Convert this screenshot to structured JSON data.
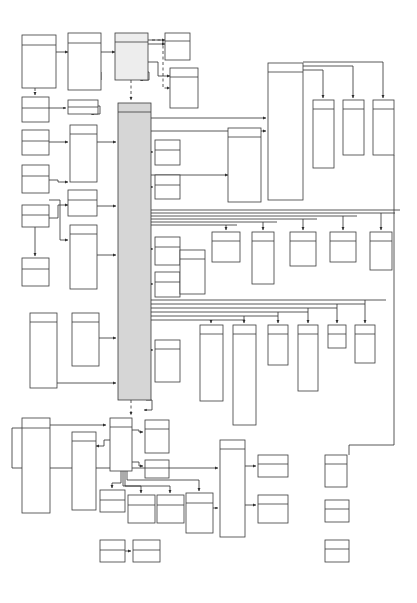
{
  "diagram": {
    "type": "uml-block-diagram",
    "background_color": "#ffffff",
    "stroke_color": "#3a3a3a",
    "node_fill": "#ffffff",
    "bus_fill": "#d6d6d6",
    "accent_fill": "#ededed",
    "canvas": {
      "width": 417,
      "height": 603
    },
    "legend": {
      "node_style": "rectangle with header band",
      "connector_style": "orthogonal polyline with solid arrowhead",
      "dashed_meaning": "dependency"
    },
    "nodes": [
      {
        "id": "n01",
        "label": "",
        "x": 22,
        "y": 35,
        "w": 34,
        "h": 53,
        "hdr": 10,
        "fill": "white"
      },
      {
        "id": "n02",
        "label": "",
        "x": 68,
        "y": 33,
        "w": 33,
        "h": 57,
        "hdr": 10,
        "fill": "white"
      },
      {
        "id": "n03",
        "label": "",
        "x": 115,
        "y": 33,
        "w": 33,
        "h": 47,
        "hdr": 9,
        "fill": "accent-light"
      },
      {
        "id": "n04",
        "label": "",
        "x": 165,
        "y": 33,
        "w": 25,
        "h": 27,
        "hdr": 8,
        "fill": "white"
      },
      {
        "id": "n05",
        "label": "",
        "x": 170,
        "y": 68,
        "w": 28,
        "h": 40,
        "hdr": 9,
        "fill": "white"
      },
      {
        "id": "n06",
        "label": "",
        "x": 22,
        "y": 97,
        "w": 27,
        "h": 25,
        "hdr": 11,
        "fill": "white"
      },
      {
        "id": "n07",
        "label": "",
        "x": 68,
        "y": 100,
        "w": 30,
        "h": 14,
        "hdr": 7,
        "fill": "white"
      },
      {
        "id": "n08",
        "label": "",
        "x": 22,
        "y": 130,
        "w": 27,
        "h": 25,
        "hdr": 11,
        "fill": "white"
      },
      {
        "id": "n09",
        "label": "",
        "x": 70,
        "y": 125,
        "w": 27,
        "h": 57,
        "hdr": 9,
        "fill": "white"
      },
      {
        "id": "n10",
        "label": "",
        "x": 22,
        "y": 165,
        "w": 27,
        "h": 28,
        "hdr": 11,
        "fill": "white"
      },
      {
        "id": "n11",
        "label": "",
        "x": 22,
        "y": 205,
        "w": 27,
        "h": 22,
        "hdr": 10,
        "fill": "white"
      },
      {
        "id": "n12",
        "label": "",
        "x": 68,
        "y": 190,
        "w": 29,
        "h": 26,
        "hdr": 10,
        "fill": "white"
      },
      {
        "id": "n13",
        "label": "",
        "x": 22,
        "y": 258,
        "w": 27,
        "h": 28,
        "hdr": 11,
        "fill": "white"
      },
      {
        "id": "n14",
        "label": "",
        "x": 70,
        "y": 225,
        "w": 27,
        "h": 64,
        "hdr": 9,
        "fill": "white"
      },
      {
        "id": "n15",
        "label": "",
        "x": 30,
        "y": 313,
        "w": 27,
        "h": 75,
        "hdr": 9,
        "fill": "white"
      },
      {
        "id": "n16",
        "label": "",
        "x": 72,
        "y": 313,
        "w": 27,
        "h": 53,
        "hdr": 9,
        "fill": "white"
      },
      {
        "id": "n17",
        "label": "",
        "x": 22,
        "y": 418,
        "w": 28,
        "h": 95,
        "hdr": 10,
        "fill": "white"
      },
      {
        "id": "n18",
        "label": "",
        "x": 72,
        "y": 432,
        "w": 24,
        "h": 78,
        "hdr": 9,
        "fill": "white"
      },
      {
        "id": "bus",
        "label": "",
        "x": 118,
        "y": 103,
        "w": 33,
        "h": 297,
        "hdr": 9,
        "fill": "accent"
      },
      {
        "id": "n20",
        "label": "",
        "x": 155,
        "y": 140,
        "w": 25,
        "h": 25,
        "hdr": 10,
        "fill": "white"
      },
      {
        "id": "n21",
        "label": "",
        "x": 155,
        "y": 175,
        "w": 25,
        "h": 24,
        "hdr": 10,
        "fill": "white"
      },
      {
        "id": "n22",
        "label": "",
        "x": 155,
        "y": 237,
        "w": 25,
        "h": 28,
        "hdr": 10,
        "fill": "white"
      },
      {
        "id": "n23",
        "label": "",
        "x": 155,
        "y": 272,
        "w": 25,
        "h": 25,
        "hdr": 10,
        "fill": "white"
      },
      {
        "id": "n24",
        "label": "",
        "x": 155,
        "y": 340,
        "w": 25,
        "h": 42,
        "hdr": 9,
        "fill": "white"
      },
      {
        "id": "n25",
        "label": "",
        "x": 180,
        "y": 250,
        "w": 25,
        "h": 44,
        "hdr": 9,
        "fill": "white"
      },
      {
        "id": "n26",
        "label": "",
        "x": 228,
        "y": 128,
        "w": 33,
        "h": 74,
        "hdr": 9,
        "fill": "white"
      },
      {
        "id": "n27",
        "label": "",
        "x": 268,
        "y": 63,
        "w": 35,
        "h": 137,
        "hdr": 9,
        "fill": "white"
      },
      {
        "id": "n28",
        "label": "",
        "x": 313,
        "y": 100,
        "w": 21,
        "h": 68,
        "hdr": 9,
        "fill": "white"
      },
      {
        "id": "n29",
        "label": "",
        "x": 343,
        "y": 100,
        "w": 21,
        "h": 55,
        "hdr": 9,
        "fill": "white"
      },
      {
        "id": "n30",
        "label": "",
        "x": 373,
        "y": 100,
        "w": 21,
        "h": 55,
        "hdr": 9,
        "fill": "white"
      },
      {
        "id": "n31",
        "label": "",
        "x": 212,
        "y": 232,
        "w": 28,
        "h": 30,
        "hdr": 9,
        "fill": "white"
      },
      {
        "id": "n32",
        "label": "",
        "x": 252,
        "y": 232,
        "w": 22,
        "h": 52,
        "hdr": 9,
        "fill": "white"
      },
      {
        "id": "n33",
        "label": "",
        "x": 290,
        "y": 232,
        "w": 26,
        "h": 34,
        "hdr": 9,
        "fill": "white"
      },
      {
        "id": "n34",
        "label": "",
        "x": 330,
        "y": 232,
        "w": 26,
        "h": 30,
        "hdr": 9,
        "fill": "white"
      },
      {
        "id": "n35",
        "label": "",
        "x": 370,
        "y": 232,
        "w": 22,
        "h": 38,
        "hdr": 9,
        "fill": "white"
      },
      {
        "id": "n36",
        "label": "",
        "x": 200,
        "y": 325,
        "w": 23,
        "h": 76,
        "hdr": 9,
        "fill": "white"
      },
      {
        "id": "n37",
        "label": "",
        "x": 233,
        "y": 325,
        "w": 23,
        "h": 100,
        "hdr": 9,
        "fill": "white"
      },
      {
        "id": "n38",
        "label": "",
        "x": 268,
        "y": 325,
        "w": 20,
        "h": 40,
        "hdr": 9,
        "fill": "white"
      },
      {
        "id": "n39",
        "label": "",
        "x": 298,
        "y": 325,
        "w": 20,
        "h": 66,
        "hdr": 9,
        "fill": "white"
      },
      {
        "id": "n40",
        "label": "",
        "x": 328,
        "y": 325,
        "w": 18,
        "h": 23,
        "hdr": 9,
        "fill": "white"
      },
      {
        "id": "n41",
        "label": "",
        "x": 355,
        "y": 325,
        "w": 20,
        "h": 38,
        "hdr": 9,
        "fill": "white"
      },
      {
        "id": "n42",
        "label": "",
        "x": 110,
        "y": 418,
        "w": 22,
        "h": 53,
        "hdr": 9,
        "fill": "white"
      },
      {
        "id": "n43",
        "label": "",
        "x": 145,
        "y": 420,
        "w": 24,
        "h": 33,
        "hdr": 9,
        "fill": "white"
      },
      {
        "id": "n44",
        "label": "",
        "x": 145,
        "y": 460,
        "w": 24,
        "h": 18,
        "hdr": 8,
        "fill": "white"
      },
      {
        "id": "n45",
        "label": "",
        "x": 100,
        "y": 490,
        "w": 25,
        "h": 22,
        "hdr": 10,
        "fill": "white"
      },
      {
        "id": "n46",
        "label": "",
        "x": 128,
        "y": 495,
        "w": 27,
        "h": 28,
        "hdr": 10,
        "fill": "white"
      },
      {
        "id": "n47",
        "label": "",
        "x": 157,
        "y": 495,
        "w": 27,
        "h": 28,
        "hdr": 10,
        "fill": "white"
      },
      {
        "id": "n48",
        "label": "",
        "x": 186,
        "y": 493,
        "w": 27,
        "h": 40,
        "hdr": 10,
        "fill": "white"
      },
      {
        "id": "n49",
        "label": "",
        "x": 100,
        "y": 540,
        "w": 25,
        "h": 22,
        "hdr": 10,
        "fill": "white"
      },
      {
        "id": "n50",
        "label": "",
        "x": 133,
        "y": 540,
        "w": 27,
        "h": 22,
        "hdr": 10,
        "fill": "white"
      },
      {
        "id": "n51",
        "label": "",
        "x": 220,
        "y": 440,
        "w": 25,
        "h": 97,
        "hdr": 9,
        "fill": "white"
      },
      {
        "id": "n52",
        "label": "",
        "x": 258,
        "y": 455,
        "w": 30,
        "h": 22,
        "hdr": 9,
        "fill": "white"
      },
      {
        "id": "n53",
        "label": "",
        "x": 258,
        "y": 495,
        "w": 30,
        "h": 28,
        "hdr": 9,
        "fill": "white"
      },
      {
        "id": "n54",
        "label": "",
        "x": 325,
        "y": 455,
        "w": 22,
        "h": 32,
        "hdr": 9,
        "fill": "white"
      },
      {
        "id": "n55",
        "label": "",
        "x": 325,
        "y": 500,
        "w": 24,
        "h": 22,
        "hdr": 9,
        "fill": "white"
      },
      {
        "id": "n56",
        "label": "",
        "x": 325,
        "y": 540,
        "w": 24,
        "h": 22,
        "hdr": 9,
        "fill": "white"
      }
    ],
    "edge_count": 62,
    "node_count": 56
  }
}
